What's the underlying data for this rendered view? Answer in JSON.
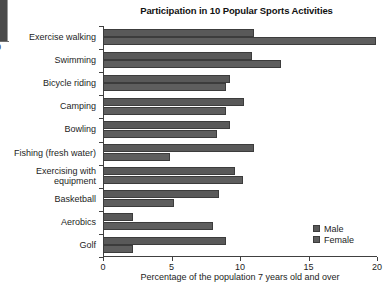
{
  "edge_artifact": {
    "label": "0",
    "name": "cropped-neighbor-axis"
  },
  "chart_data": {
    "type": "bar",
    "orientation": "horizontal",
    "title": "Participation in 10 Popular Sports Activities",
    "xlabel": "Percentage of the population 7 years old and over",
    "ylabel": "",
    "xlim": [
      0,
      20
    ],
    "xticks": [
      0,
      5,
      10,
      15,
      20
    ],
    "xtick_labels": [
      "0",
      "5",
      "10",
      "15",
      "20"
    ],
    "grid": false,
    "legend_position": "bottom-right",
    "categories": [
      "Exercise walking",
      "Swimming",
      "Bicycle riding",
      "Camping",
      "Bowling",
      "Fishing (fresh water)",
      "Exercising with equipment",
      "Basketball",
      "Aerobics",
      "Golf"
    ],
    "series": [
      {
        "name": "Male",
        "color": "#595959",
        "values": [
          11.0,
          10.9,
          9.3,
          10.3,
          9.3,
          11.0,
          9.6,
          8.5,
          2.2,
          9.0
        ]
      },
      {
        "name": "Female",
        "color": "#5e5e5e",
        "values": [
          19.9,
          13.0,
          9.0,
          9.0,
          8.3,
          4.9,
          10.2,
          5.2,
          8.0,
          2.2
        ]
      }
    ]
  },
  "legend": {
    "entries": [
      {
        "label": "Male",
        "color": "#595959"
      },
      {
        "label": "Female",
        "color": "#5e5e5e"
      }
    ]
  }
}
